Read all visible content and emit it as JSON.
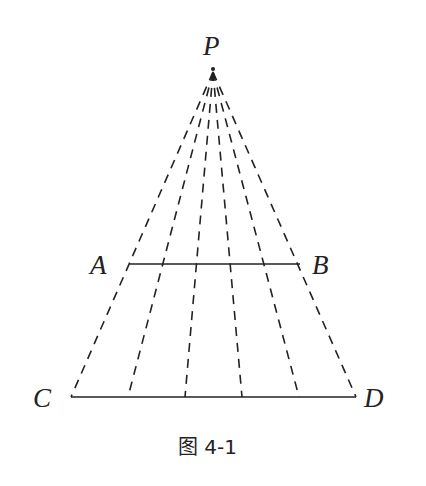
{
  "figure": {
    "caption": "图 4-1",
    "points": {
      "P": {
        "label": "P",
        "x": 213,
        "y": 68
      },
      "A": {
        "label": "A",
        "x": 130,
        "y": 264
      },
      "B": {
        "label": "B",
        "x": 300,
        "y": 264
      },
      "C": {
        "label": "C",
        "x": 71,
        "y": 397
      },
      "D": {
        "label": "D",
        "x": 356,
        "y": 397
      }
    },
    "segments": [
      {
        "name": "AB",
        "from": "A",
        "to": "B",
        "style": "solid"
      },
      {
        "name": "CD",
        "from": "C",
        "to": "D",
        "style": "solid"
      }
    ],
    "rays": {
      "from": "P",
      "count": 6,
      "style": "dashed",
      "description": "Six dashed lines from P through equally spaced points on AB, ending at equally spaced points on CD"
    },
    "colors": {
      "line": "#222222",
      "background": "#ffffff"
    }
  }
}
